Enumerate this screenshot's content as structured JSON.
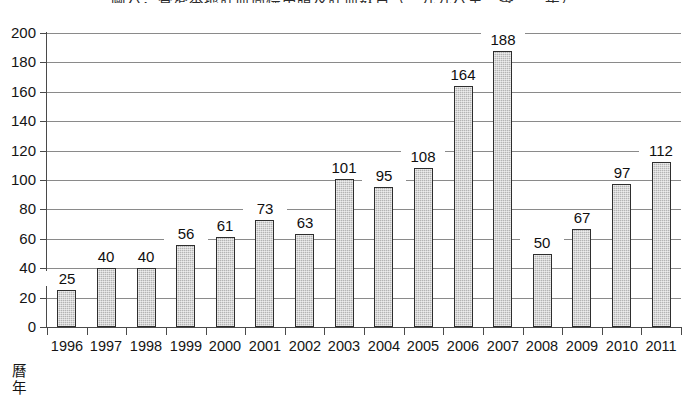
{
  "chart_data": {
    "type": "bar",
    "title": "圖六：香港本地註冊商標申請及註冊數目（一九九六至二零一一年）",
    "subtitle": "",
    "xlabel": "曆年",
    "ylabel": "",
    "categories": [
      "1996",
      "1997",
      "1998",
      "1999",
      "2000",
      "2001",
      "2002",
      "2003",
      "2004",
      "2005",
      "2006",
      "2007",
      "2008",
      "2009",
      "2010",
      "2011"
    ],
    "values": [
      25,
      40,
      40,
      56,
      61,
      73,
      63,
      101,
      95,
      108,
      164,
      188,
      50,
      67,
      97,
      112
    ],
    "data_labels": [
      "25",
      "40",
      "40",
      "56",
      "61",
      "73",
      "63",
      "101",
      "95",
      "108",
      "164",
      "188",
      "50",
      "67",
      "97",
      "112"
    ],
    "ylim": [
      0,
      200
    ],
    "ytick_step": 20,
    "ytick_labels": [
      "200",
      "180",
      "160",
      "140",
      "120",
      "100",
      "80",
      "60",
      "40",
      "20",
      "0"
    ],
    "ytick_values": [
      200,
      180,
      160,
      140,
      120,
      100,
      80,
      60,
      40,
      20,
      0
    ],
    "grid": {
      "horizontal": true,
      "vertical": false
    },
    "legend": {
      "visible": false,
      "position": "none"
    },
    "show_data_labels": true,
    "colors": {
      "bar_fill": "#b4b4b4",
      "bar_border": "#2e2e2e",
      "gridline": "#8a8a8a",
      "axis": "#4a4a4a",
      "text": "#141414",
      "background": "#ffffff"
    }
  }
}
